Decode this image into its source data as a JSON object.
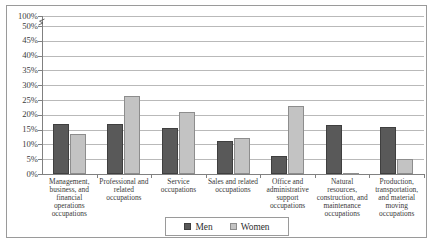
{
  "chart_data": {
    "type": "bar",
    "title": "",
    "xlabel": "",
    "ylabel": "",
    "ylim": [
      0,
      100
    ],
    "grid": true,
    "legend_position": "bottom",
    "axis_break": {
      "present": true,
      "between": [
        50,
        100
      ],
      "symbol": "zigzag"
    },
    "ytick_labels": [
      "100%",
      "50%",
      "45%",
      "40%",
      "35%",
      "30%",
      "25%",
      "20%",
      "15%",
      "10%",
      "5%",
      "0%"
    ],
    "ytick_values": [
      100,
      50,
      45,
      40,
      35,
      30,
      25,
      20,
      15,
      10,
      5,
      0
    ],
    "categories": [
      "Management, business, and financial operations occupations",
      "Professional and related occupations",
      "Service occupations",
      "Sales and related occupations",
      "Office and administrative support occupations",
      "Natural resources, construction, and maintenance occupations",
      "Production, transportation, and material moving occupations"
    ],
    "series": [
      {
        "name": "Men",
        "color": "#595959",
        "values": [
          17,
          17,
          15.5,
          11,
          6,
          16.5,
          16
        ]
      },
      {
        "name": "Women",
        "color": "#c3c3c3",
        "values": [
          13.5,
          26.5,
          21,
          12,
          23,
          0.5,
          5
        ]
      }
    ]
  },
  "ylabels": {
    "t0": "100%",
    "t1": "50%",
    "t2": "45%",
    "t3": "40%",
    "t4": "35%",
    "t5": "30%",
    "t6": "25%",
    "t7": "20%",
    "t8": "15%",
    "t9": "10%",
    "t10": "5%",
    "t11": "0%"
  },
  "categories": {
    "c0": "Management, business, and financial operations occupations",
    "c1": "Professional and related occupations",
    "c2": "Service occupations",
    "c3": "Sales and related occupations",
    "c4": "Office and administrative support occupations",
    "c5": "Natural resources, construction, and maintenance occupations",
    "c6": "Production, transportation, and material moving occupations"
  },
  "legend": {
    "men_label": "Men",
    "women_label": "Women"
  }
}
